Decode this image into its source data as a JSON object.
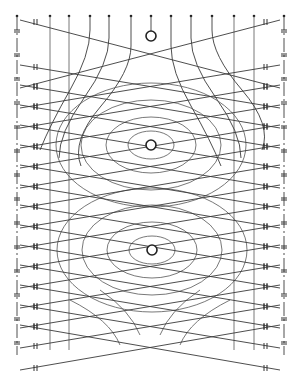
{
  "diagram": {
    "width": 299,
    "height": 375,
    "stroke_color": "#3a3a3a",
    "background": "#ffffff",
    "vertical_lines_x": [
      17,
      50,
      69,
      90,
      109,
      131,
      151,
      171,
      191,
      212,
      234,
      254,
      284
    ],
    "straight_vertical_x": [
      50,
      69,
      234,
      254
    ],
    "top_y": 16,
    "bottom_y": 355,
    "nodes": [
      {
        "name": "top-node",
        "cx": 151,
        "cy": 36,
        "r": 5
      },
      {
        "name": "middle-node",
        "cx": 151,
        "cy": 145,
        "r": 5
      },
      {
        "name": "bottom-node",
        "cx": 152,
        "cy": 250,
        "r": 5
      }
    ],
    "ellipse_sets": [
      {
        "cx": 151,
        "cy": 145,
        "radii": [
          [
            23,
            14
          ],
          [
            45,
            28
          ],
          [
            70,
            45
          ],
          [
            95,
            62
          ]
        ]
      },
      {
        "cx": 152,
        "cy": 250,
        "radii": [
          [
            23,
            14
          ],
          [
            45,
            28
          ],
          [
            70,
            45
          ],
          [
            95,
            62
          ]
        ]
      }
    ],
    "left_edge_x": 17,
    "right_edge_x": 284,
    "crossing_rows_y": [
      20,
      58,
      65,
      78,
      85,
      98,
      105,
      118,
      125,
      138,
      145,
      158,
      165,
      178,
      185,
      198,
      205,
      218,
      225,
      238,
      245,
      258,
      265,
      278,
      285,
      298,
      305,
      318,
      325,
      340
    ]
  }
}
